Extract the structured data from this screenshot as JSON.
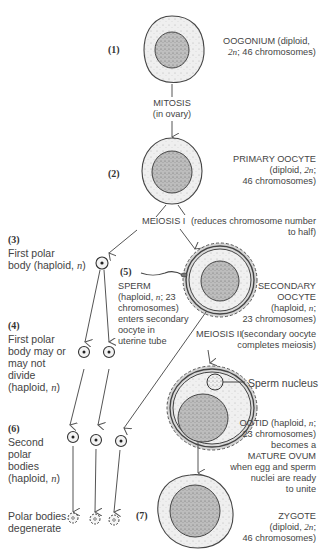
{
  "diagram": {
    "colors": {
      "outline": "#3a3a3a",
      "cytoplasm": "#ececec",
      "nucleus": "#bdbdbd",
      "zona": "#d0d0d0",
      "text": "#444444"
    },
    "stages": {
      "s1": {
        "number": "(1)",
        "name": "OOGONIUM (diploid,",
        "detail": "2n; 46 chromosomes)"
      },
      "mitosis": {
        "label": "MITOSIS",
        "sub": "(in ovary)"
      },
      "s2": {
        "number": "(2)",
        "name": "PRIMARY OOCYTE",
        "detail1": "(diploid, 2n;",
        "detail2": "46 chromosomes)"
      },
      "meiosis1": {
        "label": "MEIOSIS I",
        "note1": "(reduces chromosome number",
        "note2": "to half)"
      },
      "s3": {
        "number": "(3)",
        "line1": "First polar",
        "line2": "body (haploid, n)"
      },
      "s4": {
        "number": "(4)",
        "line1": "First polar",
        "line2": "body may or",
        "line3": "may not",
        "line4": "divide",
        "line5": "(haploid, n)"
      },
      "s5": {
        "number": "(5)",
        "line1": "SPERM",
        "line2": "(haploid, n; 23",
        "line3": "chromosomes)",
        "line4": "enters secondary",
        "line5": "oocyte in",
        "line6": "uterine tube"
      },
      "secondary": {
        "line1": "SECONDARY",
        "line2": "OOCYTE",
        "line3": "(haploid, n;",
        "line4": "23 chromosomes)"
      },
      "meiosis2": {
        "label": "MEIOSIS II",
        "note1": "(secondary oocyte",
        "note2": "completes meiosis)"
      },
      "sperm_nucleus": {
        "label": "Sperm nucleus"
      },
      "ootid": {
        "line1": "OOTID (haploid, n;",
        "line2": "23 chromosomes)",
        "line3": "becomes a",
        "line4": "MATURE OVUM",
        "line5": "when egg and sperm",
        "line6": "nuclei are ready",
        "line7": "to unite"
      },
      "s6": {
        "number": "(6)",
        "line1": "Second",
        "line2": "polar",
        "line3": "bodies",
        "line4": "(haploid, n)"
      },
      "degenerate": {
        "line1": "Polar bodies",
        "line2": "degenerate"
      },
      "s7": {
        "number": "(7)",
        "line1": "ZYGOTE",
        "line2": "(diploid, 2n;",
        "line3": "46 chromosomes)"
      }
    }
  }
}
